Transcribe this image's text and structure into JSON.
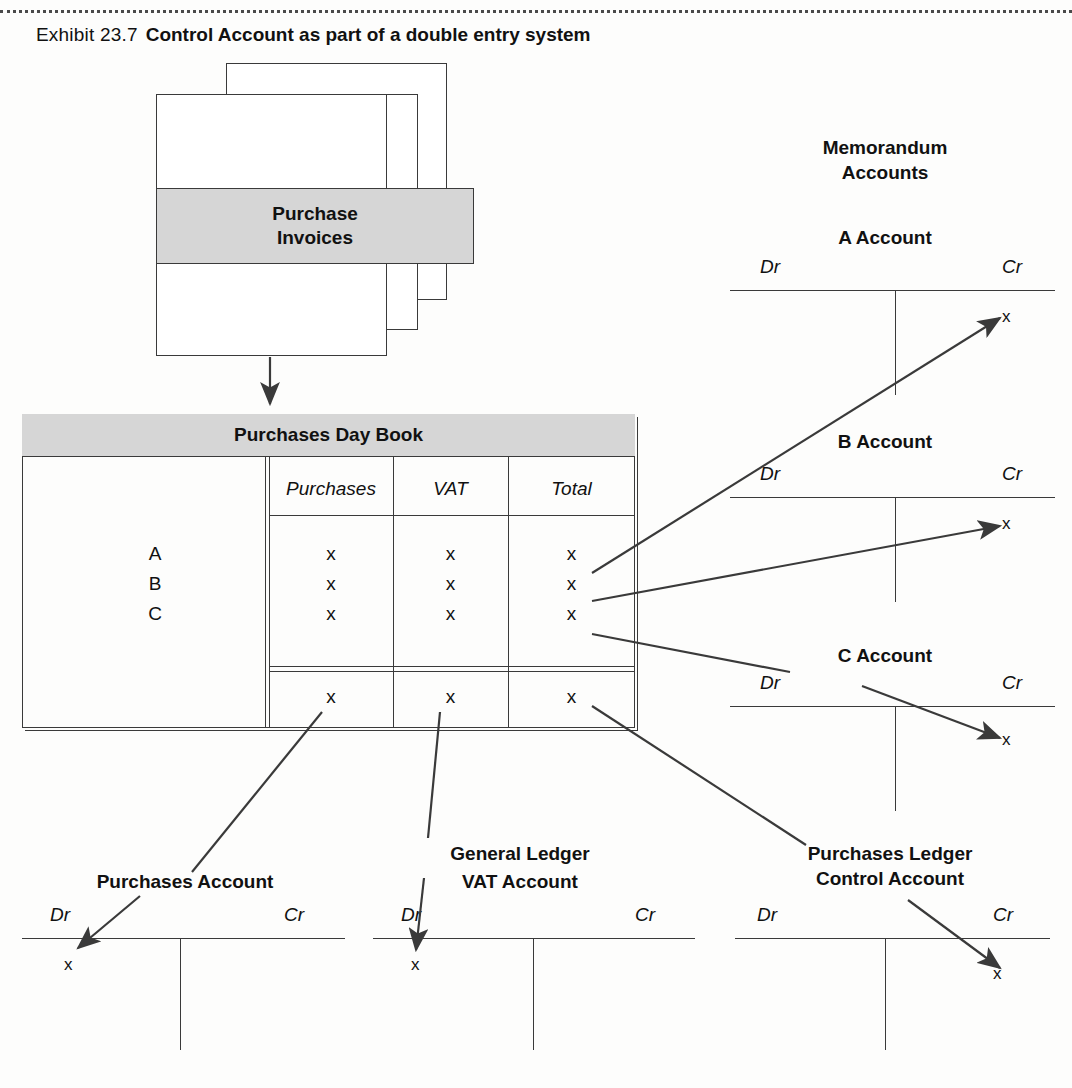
{
  "exhibit": {
    "label": "Exhibit 23.7",
    "title": "Control Account as part of a double entry system"
  },
  "source_document": {
    "label_line1": "Purchase",
    "label_line2": "Invoices"
  },
  "day_book": {
    "title": "Purchases Day Book",
    "columns": [
      "Purchases",
      "VAT",
      "Total"
    ],
    "row_labels": [
      "A",
      "B",
      "C"
    ],
    "rows": [
      {
        "label": "A",
        "purchases": "x",
        "vat": "x",
        "total": "x"
      },
      {
        "label": "B",
        "purchases": "x",
        "vat": "x",
        "total": "x"
      },
      {
        "label": "C",
        "purchases": "x",
        "vat": "x",
        "total": "x"
      }
    ],
    "totals": {
      "purchases": "x",
      "vat": "x",
      "total": "x"
    }
  },
  "memorandum": {
    "heading_line1": "Memorandum",
    "heading_line2": "Accounts",
    "accounts": [
      {
        "title": "A Account",
        "dr": "Dr",
        "cr": "Cr",
        "credit_value": "x",
        "debit_value": ""
      },
      {
        "title": "B Account",
        "dr": "Dr",
        "cr": "Cr",
        "credit_value": "x",
        "debit_value": ""
      },
      {
        "title": "C Account",
        "dr": "Dr",
        "cr": "Cr",
        "credit_value": "x",
        "debit_value": ""
      }
    ]
  },
  "general_ledger": {
    "heading": "General Ledger",
    "accounts": [
      {
        "title": "Purchases Account",
        "dr": "Dr",
        "cr": "Cr",
        "debit_value": "x",
        "credit_value": ""
      },
      {
        "title": "VAT Account",
        "dr": "Dr",
        "cr": "Cr",
        "debit_value": "x",
        "credit_value": ""
      },
      {
        "title_line1": "Purchases Ledger",
        "title_line2": "Control Account",
        "dr": "Dr",
        "cr": "Cr",
        "debit_value": "",
        "credit_value": "x"
      }
    ]
  },
  "colors": {
    "band_fill": "#d6d6d6",
    "line": "#3a3a3a",
    "text": "#111111",
    "page": "#fdfdfc"
  }
}
